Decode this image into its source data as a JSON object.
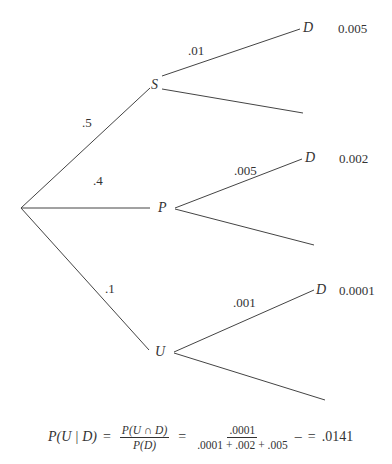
{
  "tree": {
    "root": {
      "x": 21,
      "y": 208
    },
    "stage1": [
      {
        "node": "S",
        "prob": ".5",
        "x": 150,
        "y": 88
      },
      {
        "node": "P",
        "prob": ".4",
        "x": 150,
        "y": 208
      },
      {
        "node": "U",
        "prob": ".1",
        "x": 150,
        "y": 350
      }
    ],
    "stage2": [
      {
        "parent": "S",
        "branch_prob": ".01",
        "outcome": "D",
        "joint": "0.005"
      },
      {
        "parent": "P",
        "branch_prob": ".005",
        "outcome": "D",
        "joint": "0.002"
      },
      {
        "parent": "U",
        "branch_prob": ".001",
        "outcome": "D",
        "joint": "0.0001"
      }
    ]
  },
  "formula": {
    "lhs": "P(U | D)",
    "eq1": "=",
    "frac1_num": "P(U ∩ D)",
    "frac1_den": "P(D)",
    "eq2": "=",
    "frac2_num": ".0001",
    "frac2_den": ".0001 + .002 + .005",
    "dash": "–",
    "eq3": "=",
    "result": ".0141"
  },
  "colors": {
    "line": "#444444",
    "text": "#333333",
    "background": "#ffffff"
  }
}
